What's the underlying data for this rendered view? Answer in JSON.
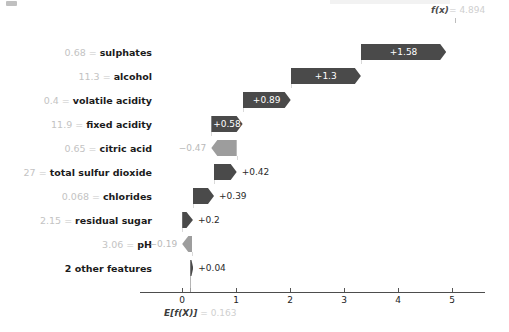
{
  "chart_data": {
    "type": "bar",
    "subtype": "shap-waterfall",
    "title": "",
    "xlabel": "",
    "ylabel": "",
    "xlim": [
      -0.35,
      5.45
    ],
    "xticks": [
      "0",
      "1",
      "2",
      "3",
      "4",
      "5"
    ],
    "xtick_values": [
      0,
      1,
      2,
      3,
      4,
      5
    ],
    "grid": false,
    "legend": null,
    "base_value": 0.163,
    "base_value_label": "E[f(X)]",
    "base_value_text": "= 0.163",
    "output_value": 4.894,
    "output_label": "f(x)",
    "output_value_text": "= 4.894",
    "categories": [
      "sulphates",
      "alcohol",
      "volatile acidity",
      "fixed acidity",
      "citric acid",
      "total sulfur dioxide",
      "chlorides",
      "residual sugar",
      "pH",
      "2 other features"
    ],
    "values": [
      1.58,
      1.3,
      0.89,
      0.58,
      -0.47,
      0.42,
      0.39,
      0.2,
      -0.19,
      0.04
    ],
    "feature_values": [
      "0.68",
      "11.3",
      "0.4",
      "11.9",
      "0.65",
      "27",
      "0.068",
      "2.15",
      "3.06",
      ""
    ]
  },
  "colors": {
    "positive_bar": "#4a4a4a",
    "negative_bar": "#9d9d9d",
    "axis": "#4d4d4d",
    "feature_name": "#1b1b1b",
    "feature_value": "#c3c3c3",
    "connector": "#d9d9d9"
  },
  "rows": [
    {
      "name": "sulphates",
      "value_text": "0.68",
      "sep": "=",
      "delta": "+1.58",
      "delta_num": 1.58,
      "start": 3.313,
      "end": 4.893,
      "sign": "pos",
      "label_pos": "inside"
    },
    {
      "name": "alcohol",
      "value_text": "11.3",
      "sep": "=",
      "delta": "+1.3",
      "delta_num": 1.3,
      "start": 2.013,
      "end": 3.313,
      "sign": "pos",
      "label_pos": "inside"
    },
    {
      "name": "volatile acidity",
      "value_text": "0.4",
      "sep": "=",
      "delta": "+0.89",
      "delta_num": 0.89,
      "start": 1.123,
      "end": 2.013,
      "sign": "pos",
      "label_pos": "inside"
    },
    {
      "name": "fixed acidity",
      "value_text": "11.9",
      "sep": "=",
      "delta": "+0.58",
      "delta_num": 0.58,
      "start": 0.543,
      "end": 1.123,
      "sign": "pos",
      "label_pos": "inside"
    },
    {
      "name": "citric acid",
      "value_text": "0.65",
      "sep": "=",
      "delta": "−0.47",
      "delta_num": -0.47,
      "start": 1.013,
      "end": 0.543,
      "sign": "neg",
      "label_pos": "out-left"
    },
    {
      "name": "total sulfur dioxide",
      "value_text": "27",
      "sep": "=",
      "delta": "+0.42",
      "delta_num": 0.42,
      "start": 0.593,
      "end": 1.013,
      "sign": "pos",
      "label_pos": "out-right"
    },
    {
      "name": "chlorides",
      "value_text": "0.068",
      "sep": "=",
      "delta": "+0.39",
      "delta_num": 0.39,
      "start": 0.203,
      "end": 0.593,
      "sign": "pos",
      "label_pos": "out-right"
    },
    {
      "name": "residual sugar",
      "value_text": "2.15",
      "sep": "=",
      "delta": "+0.2",
      "delta_num": 0.2,
      "start": 0.003,
      "end": 0.203,
      "sign": "pos",
      "label_pos": "out-right"
    },
    {
      "name": "pH",
      "value_text": "3.06",
      "sep": "=",
      "delta": "−0.19",
      "delta_num": -0.19,
      "start": 0.193,
      "end": 0.003,
      "sign": "neg",
      "label_pos": "out-left"
    },
    {
      "name": "2 other features",
      "value_text": "",
      "sep": "",
      "delta": "+0.04",
      "delta_num": 0.04,
      "start": 0.153,
      "end": 0.193,
      "sign": "pos",
      "label_pos": "out-right"
    }
  ],
  "axis": {
    "ticks": [
      "0",
      "1",
      "2",
      "3",
      "4",
      "5"
    ]
  },
  "annotations": {
    "fx_label": "f(x)",
    "fx_eq": "=",
    "fx_value": "4.894",
    "base_label": "E[f(X)]",
    "base_eq": "=",
    "base_value": "0.163"
  }
}
